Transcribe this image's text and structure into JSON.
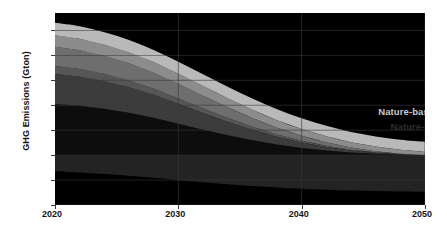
{
  "chart_data": {
    "type": "area",
    "stacked": true,
    "title": "",
    "xlabel": "",
    "ylabel": "GHG Emissions (Gton)",
    "x": [
      2020,
      2022,
      2024,
      2026,
      2028,
      2030,
      2032,
      2034,
      2036,
      2038,
      2040,
      2042,
      2044,
      2046,
      2048,
      2050
    ],
    "xlim": [
      2020,
      2050
    ],
    "ylim": [
      -20,
      57
    ],
    "yticks": [
      -20,
      -10,
      0,
      10,
      20,
      30,
      40,
      50
    ],
    "xticks": [
      2020,
      2030,
      2040,
      2050
    ],
    "xtick_labels": [
      "2020",
      "2030",
      "2040",
      "2050"
    ],
    "ytick_labels": [
      "50",
      "40",
      "30",
      "20",
      "10",
      "0",
      "-10",
      "-20"
    ],
    "grid": true,
    "legend_position": "inside-top-right",
    "series": [
      {
        "name": "Energy",
        "color": "#0d0d0d",
        "label_color": "#3a3a3a",
        "values": [
          20.5,
          19.8,
          18.6,
          17.0,
          15.0,
          12.6,
          10.2,
          8.0,
          6.0,
          4.3,
          2.9,
          1.9,
          1.1,
          0.6,
          0.2,
          0.0
        ]
      },
      {
        "name": "Industry",
        "color": "#3c3c3c",
        "label_color": "#dcdcdc",
        "values": [
          12.0,
          11.6,
          11.0,
          10.2,
          9.2,
          8.0,
          6.7,
          5.4,
          4.2,
          3.1,
          2.2,
          1.4,
          0.8,
          0.4,
          0.15,
          0.0
        ]
      },
      {
        "name": "Buildings",
        "color": "#565656",
        "label_color": "#b4b4b4",
        "values": [
          3.2,
          3.1,
          2.9,
          2.7,
          2.4,
          2.1,
          1.8,
          1.5,
          1.2,
          0.9,
          0.65,
          0.45,
          0.28,
          0.15,
          0.06,
          0.0
        ]
      },
      {
        "name": "Transport",
        "color": "#6e6e6e",
        "label_color": "#ededed",
        "values": [
          7.8,
          7.6,
          7.3,
          6.9,
          6.4,
          5.8,
          5.1,
          4.3,
          3.5,
          2.7,
          2.0,
          1.4,
          0.85,
          0.45,
          0.18,
          0.0
        ]
      },
      {
        "name": "Food",
        "color": "#8c8c8c",
        "label_color": "#ffffff",
        "values": [
          4.6,
          4.6,
          4.5,
          4.4,
          4.3,
          4.1,
          3.9,
          3.6,
          3.3,
          3.0,
          2.7,
          2.4,
          2.1,
          1.85,
          1.6,
          1.4
        ]
      },
      {
        "name": "Nature-based sources",
        "color": "#b9b9b9",
        "label_color": "#c9c9c9",
        "values": [
          5.0,
          5.0,
          5.0,
          5.0,
          4.9,
          4.8,
          4.7,
          4.6,
          4.5,
          4.4,
          4.3,
          4.2,
          4.1,
          4.05,
          4.0,
          4.0
        ]
      },
      {
        "name": "Nature-based sinks",
        "color": "#232323",
        "label_color": "#2e2e2e",
        "values": [
          -6.5,
          -7.0,
          -7.6,
          -8.3,
          -9.1,
          -10.0,
          -10.9,
          -11.7,
          -12.4,
          -13.0,
          -13.5,
          -13.9,
          -14.2,
          -14.4,
          -14.6,
          -14.7
        ]
      }
    ],
    "background_color": "#000000",
    "gridline_color": "#3a3a3a"
  }
}
